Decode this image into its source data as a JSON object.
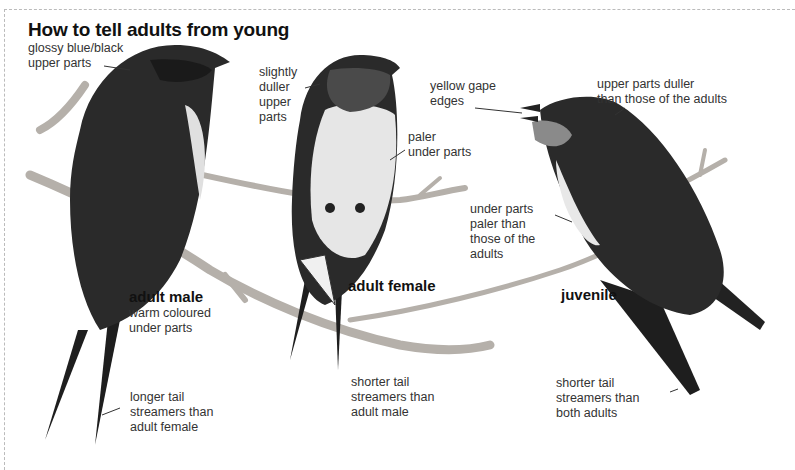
{
  "title": "How to tell adults from young",
  "birds": {
    "male": {
      "name": "adult male",
      "labels": {
        "upper": "glossy blue/black\nupper parts",
        "under": "warm coloured\nunder parts",
        "tail": "longer tail\nstreamers than\nadult female"
      }
    },
    "female": {
      "name": "adult female",
      "labels": {
        "upper": "slightly\nduller\nupper\nparts",
        "under": "paler\nunder parts",
        "tail": "shorter tail\nstreamers than\nadult male"
      }
    },
    "juvenile": {
      "name": "juvenile",
      "labels": {
        "gape": "yellow gape\nedges",
        "upper": "upper parts duller\nthan those of the adults",
        "under": "under parts\npaler than\nthose of the\nadults",
        "tail": "shorter tail\nstreamers than\nboth adults"
      }
    }
  },
  "colors": {
    "dark_plumage": "#2a2a2a",
    "throat": "#555555",
    "pale_underparts": "#e8e8e8",
    "branch": "#b5b0aa"
  }
}
